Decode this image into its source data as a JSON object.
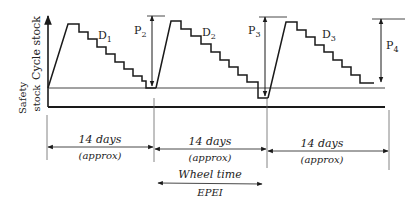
{
  "axis": {
    "y_label_top": "Cycle stock",
    "y_label_bottom_line1": "Safety",
    "y_label_bottom_line2": "stock"
  },
  "demand_labels": [
    {
      "base": "D",
      "sub": "1"
    },
    {
      "base": "D",
      "sub": "2"
    },
    {
      "base": "D",
      "sub": "3"
    }
  ],
  "production_labels": [
    {
      "base": "P",
      "sub": "2"
    },
    {
      "base": "P",
      "sub": "3"
    },
    {
      "base": "P",
      "sub": "4"
    }
  ],
  "periods": [
    {
      "duration": "14 days",
      "note": "(approx)"
    },
    {
      "duration": "14 days",
      "note": "(approx)"
    },
    {
      "duration": "14 days",
      "note": "(approx)"
    }
  ],
  "wheel": {
    "label": "Wheel time",
    "sublabel": "EPEI"
  },
  "colors": {
    "line": "#1a1a1a",
    "thin": "#555555",
    "text": "#222222"
  }
}
